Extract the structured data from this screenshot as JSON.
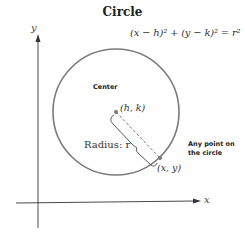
{
  "title": "Circle",
  "equation": "(x − h)² + (y − k)² = r²",
  "labels": {
    "center": "Center",
    "center_point": "(h, k)",
    "radius": "Radius: r",
    "point_on_circle": "(x, y)",
    "any_point_line1": "Any point on",
    "any_point_line2": "the circle"
  },
  "axes": {
    "x_label": "x",
    "y_label": "y"
  },
  "colors": {
    "circle": "#7a7a7a",
    "axes": "#333333",
    "text": "#222222"
  }
}
